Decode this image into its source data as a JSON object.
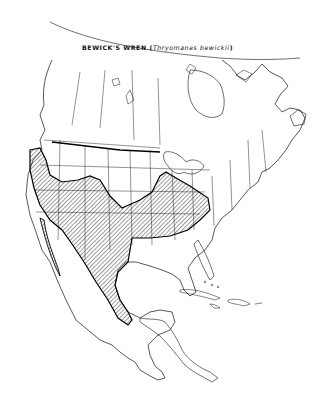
{
  "map": {
    "title_common": "BEWICK'S WREN",
    "title_open": " (",
    "title_scientific": "Thryomanes bewickii",
    "title_close": ")",
    "region": "North America",
    "legend": "Hatched area = breeding range",
    "colors": {
      "background": "#ffffff",
      "lines": "#111111",
      "range_outline": "#000000",
      "hatch": "#222222"
    }
  }
}
